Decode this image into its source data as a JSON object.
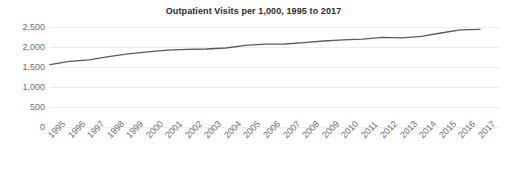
{
  "chart_data": {
    "type": "line",
    "title": "Outpatient Visits per 1,000, 1995 to 2017",
    "xlabel": "",
    "ylabel": "",
    "categories": [
      "1995",
      "1996",
      "1997",
      "1998",
      "1999",
      "2000",
      "2001",
      "2002",
      "2003",
      "2004",
      "2005",
      "2006",
      "2007",
      "2008",
      "2009",
      "2010",
      "2011",
      "2012",
      "2013",
      "2014",
      "2015",
      "2016",
      "2017"
    ],
    "values": [
      1560,
      1640,
      1680,
      1760,
      1830,
      1880,
      1920,
      1940,
      1950,
      1975,
      2040,
      2070,
      2075,
      2110,
      2150,
      2180,
      2195,
      2240,
      2230,
      2265,
      2350,
      2430,
      2440
    ],
    "series": [
      {
        "name": "Outpatient Visits per 1,000",
        "values": [
          1560,
          1640,
          1680,
          1760,
          1830,
          1880,
          1920,
          1940,
          1950,
          1975,
          2040,
          2070,
          2075,
          2110,
          2150,
          2180,
          2195,
          2240,
          2230,
          2265,
          2350,
          2430,
          2440
        ]
      }
    ],
    "ylim": [
      0,
      2500
    ],
    "yticks": [
      0,
      500,
      1000,
      1500,
      2000,
      2500
    ],
    "ytick_labels": [
      "0",
      "500",
      "1,000",
      "1,500",
      "2,000",
      "2,500"
    ],
    "grid": true,
    "grid_axis": "y",
    "legend": false,
    "legend_position": "none",
    "colors": {
      "line": "#5a5a5a",
      "grid": "#ededed",
      "tick_text": "#6d6d6d",
      "title_text": "#2b2b2b",
      "background": "#ffffff"
    },
    "line_width": 1.3,
    "markers": false,
    "xtick_rotation": -45
  },
  "layout": {
    "plot_left": 50,
    "plot_right": 480,
    "y_zero_px": 127,
    "y_top_px": 27,
    "px_per_500": 20
  }
}
